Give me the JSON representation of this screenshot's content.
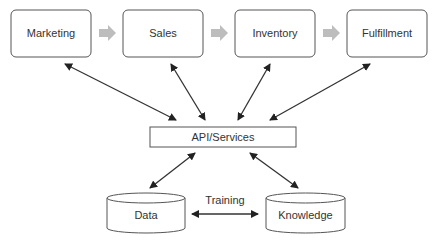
{
  "diagram": {
    "top_row": [
      {
        "label": "Marketing"
      },
      {
        "label": "Sales"
      },
      {
        "label": "Inventory"
      },
      {
        "label": "Fulfillment"
      }
    ],
    "hub": {
      "label": "API/Services"
    },
    "stores": [
      {
        "label": "Data"
      },
      {
        "label": "Knowledge"
      }
    ],
    "edge_label": "Training",
    "colors": {
      "stroke": "#444444",
      "flow_arrow": "#bdbdbd",
      "text": "#333333"
    }
  }
}
